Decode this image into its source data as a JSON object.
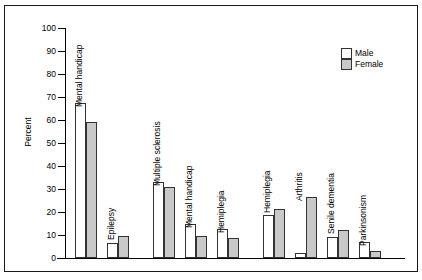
{
  "chart_data": {
    "type": "bar",
    "title": "",
    "xlabel": "",
    "ylabel": "Percent",
    "ylim": [
      0,
      100
    ],
    "ytick_step": 10,
    "yticks": [
      100,
      90,
      80,
      70,
      60,
      50,
      40,
      30,
      20,
      10,
      0
    ],
    "grid": false,
    "legend_position": "top-right",
    "series": [
      {
        "name": "Male",
        "color": "#ffffff",
        "values": [
          67.5,
          6.5,
          33,
          15,
          12.5,
          18.5,
          2,
          9,
          7
        ]
      },
      {
        "name": "Female",
        "color": "#c9c9c9",
        "values": [
          59,
          9.5,
          31,
          9.5,
          8.5,
          21.5,
          26.5,
          12,
          3
        ]
      }
    ],
    "categories": [
      "Mental handicap",
      "Epilepsy",
      "Multiple sclerosis",
      "Mental handicap",
      "Hemiplegia",
      "Hemiplegia",
      "Arthritis",
      "Senile dementia",
      "Parkinsonism"
    ],
    "groups": [
      {
        "label": "5 – 14",
        "categories": [
          0,
          1
        ]
      },
      {
        "label": "15 – 64",
        "categories": [
          2,
          3,
          4
        ]
      },
      {
        "label": "65+",
        "categories": [
          5,
          6,
          7,
          8
        ]
      }
    ]
  },
  "legend": {
    "items": [
      {
        "label": "Male"
      },
      {
        "label": "Female"
      }
    ]
  }
}
